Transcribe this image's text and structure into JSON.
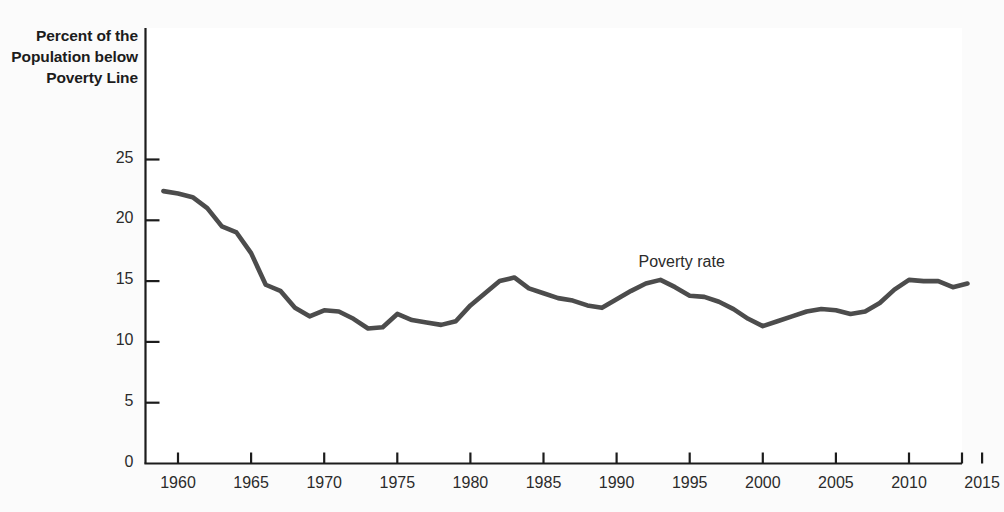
{
  "chart_data": {
    "type": "line",
    "title": "",
    "ylabel": "Percent of the Population below Poverty Line",
    "xlabel": "",
    "xlim": [
      1958.5,
      2015
    ],
    "ylim": [
      0,
      26.5
    ],
    "yticks": [
      0,
      5,
      10,
      15,
      20,
      25
    ],
    "xticks": [
      1960,
      1965,
      1970,
      1975,
      1980,
      1985,
      1990,
      1995,
      2000,
      2005,
      2010,
      2015
    ],
    "grid": false,
    "legend_position": "inline-annotation",
    "series": [
      {
        "name": "Poverty rate",
        "color": "#4c4c4c",
        "annotation": "Poverty rate",
        "annotation_x": 1991.5,
        "annotation_y": 16.5,
        "x": [
          1959,
          1960,
          1961,
          1962,
          1963,
          1964,
          1965,
          1966,
          1967,
          1968,
          1969,
          1970,
          1971,
          1972,
          1973,
          1974,
          1975,
          1976,
          1977,
          1978,
          1979,
          1980,
          1981,
          1982,
          1983,
          1984,
          1985,
          1986,
          1987,
          1988,
          1989,
          1990,
          1991,
          1992,
          1993,
          1994,
          1995,
          1996,
          1997,
          1998,
          1999,
          2000,
          2001,
          2002,
          2003,
          2004,
          2005,
          2006,
          2007,
          2008,
          2009,
          2010,
          2011,
          2012,
          2013,
          2014
        ],
        "y": [
          22.4,
          22.2,
          21.9,
          21.0,
          19.5,
          19.0,
          17.3,
          14.7,
          14.2,
          12.8,
          12.1,
          12.6,
          12.5,
          11.9,
          11.1,
          11.2,
          12.3,
          11.8,
          11.6,
          11.4,
          11.7,
          13.0,
          14.0,
          15.0,
          15.3,
          14.4,
          14.0,
          13.6,
          13.4,
          13.0,
          12.8,
          13.5,
          14.2,
          14.8,
          15.1,
          14.5,
          13.8,
          13.7,
          13.3,
          12.7,
          11.9,
          11.3,
          11.7,
          12.1,
          12.5,
          12.7,
          12.6,
          12.3,
          12.5,
          13.2,
          14.3,
          15.1,
          15.0,
          15.0,
          14.5,
          14.8
        ]
      }
    ]
  },
  "figure": {
    "background_color": "#fbfbfb",
    "plot_background_color": "#ffffff",
    "axis_color": "#1c1c1c",
    "line_color": "#4c4c4c"
  }
}
